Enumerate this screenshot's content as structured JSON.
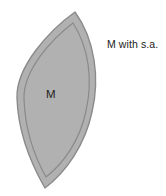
{
  "figure": {
    "type": "lens-shape-diagram",
    "background_color": "#ffffff",
    "shape": {
      "name": "lens-body",
      "description": "vesica / leaf lens shape with inner offset contour",
      "fill_color": "#b0b0b0",
      "outline_color": "#8a8a8a",
      "inner_contour_color": "#8a8a8a",
      "top_tip": {
        "x": 75,
        "y": 12
      },
      "bottom_tip": {
        "x": 45,
        "y": 188
      },
      "left_extent": 17,
      "right_extent": 98
    },
    "inner_label": "M",
    "annotation": "M with s.a."
  }
}
